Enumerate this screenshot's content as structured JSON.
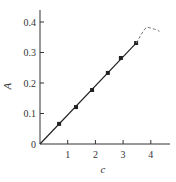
{
  "chart_data": {
    "type": "line",
    "title": "",
    "xlabel": "c",
    "ylabel": "A",
    "xlim": [
      0,
      4.3
    ],
    "ylim": [
      0,
      0.45
    ],
    "x_ticks": [
      1,
      2,
      3,
      4
    ],
    "x_tick_labels": [
      "1",
      "2",
      "3",
      "4"
    ],
    "y_ticks": [
      0,
      0.1,
      0.2,
      0.3,
      0.4
    ],
    "y_tick_labels": [
      "0",
      "0.1",
      "0.2",
      "0.3",
      "0.4"
    ],
    "grid": false,
    "legend": null,
    "series": [
      {
        "name": "measured",
        "style": "solid-line-with-markers",
        "color": "#222222",
        "x": [
          0.69,
          1.3,
          1.88,
          2.45,
          2.92,
          3.47
        ],
        "y": [
          0.066,
          0.121,
          0.177,
          0.233,
          0.282,
          0.331
        ]
      },
      {
        "name": "linear-fit",
        "style": "solid-line",
        "color": "#222222",
        "x": [
          0,
          3.47
        ],
        "y": [
          0,
          0.331
        ]
      },
      {
        "name": "deviation",
        "style": "dashed-curve",
        "color": "#777777",
        "x": [
          3.47,
          3.8,
          4.0,
          4.3
        ],
        "y": [
          0.331,
          0.36,
          0.38,
          0.368
        ]
      }
    ]
  }
}
